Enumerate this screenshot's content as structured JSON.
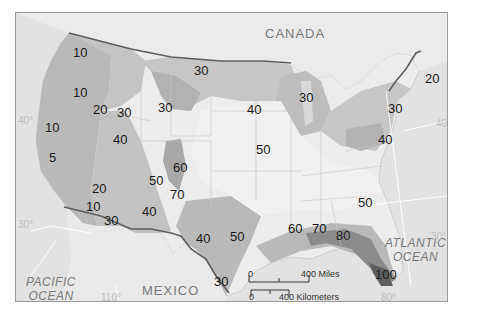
{
  "map": {
    "type": "choropleth",
    "subject": "Contiguous United States with isoline/shaded values",
    "regions": {
      "canada": "CANADA",
      "mexico": "MEXICO",
      "pacific": [
        "PACIFIC",
        "OCEAN"
      ],
      "atlantic": [
        "ATLANTIC",
        "OCEAN"
      ]
    },
    "degree_labels": {
      "lat40_west": "40°",
      "lat40_east": "40°",
      "lat30_west": "30°",
      "lat30_east": "30°",
      "lon110": "110°",
      "lon80": "80°"
    },
    "value_labels": [
      {
        "id": "wa",
        "value": "10"
      },
      {
        "id": "or",
        "value": "10"
      },
      {
        "id": "ca_n",
        "value": "10"
      },
      {
        "id": "ca_c",
        "value": "5"
      },
      {
        "id": "id_s",
        "value": "20"
      },
      {
        "id": "id_e",
        "value": "30"
      },
      {
        "id": "mt",
        "value": "30"
      },
      {
        "id": "wy",
        "value": "30"
      },
      {
        "id": "nv",
        "value": "40"
      },
      {
        "id": "ca_s",
        "value": "20"
      },
      {
        "id": "az_w",
        "value": "10"
      },
      {
        "id": "az_s",
        "value": "30"
      },
      {
        "id": "nm",
        "value": "40"
      },
      {
        "id": "ut",
        "value": "50"
      },
      {
        "id": "co",
        "value": "60"
      },
      {
        "id": "co_s",
        "value": "70"
      },
      {
        "id": "sd",
        "value": "40"
      },
      {
        "id": "mn",
        "value": "30"
      },
      {
        "id": "ia",
        "value": "50"
      },
      {
        "id": "tx_w",
        "value": "40"
      },
      {
        "id": "tx_c",
        "value": "50"
      },
      {
        "id": "tx_s",
        "value": "30"
      },
      {
        "id": "ms",
        "value": "60"
      },
      {
        "id": "al",
        "value": "70"
      },
      {
        "id": "ga",
        "value": "80"
      },
      {
        "id": "fl",
        "value": "100"
      },
      {
        "id": "sc",
        "value": "50"
      },
      {
        "id": "pa",
        "value": "40"
      },
      {
        "id": "ny",
        "value": "30"
      },
      {
        "id": "me",
        "value": "20"
      }
    ],
    "scale_bar": {
      "miles_zero": "0",
      "miles_label": "400 Miles",
      "km_zero": "0",
      "km_label": "400 Kilometers"
    },
    "colors": {
      "background": "#e4e4e4",
      "land": "#ececec",
      "lightest": "#f4f4f4",
      "light": "#d4d4d4",
      "mid": "#b9b9b9",
      "dark": "#9c9c9c",
      "darkest": "#6e6e6e",
      "border": "#5e5e5e"
    }
  }
}
